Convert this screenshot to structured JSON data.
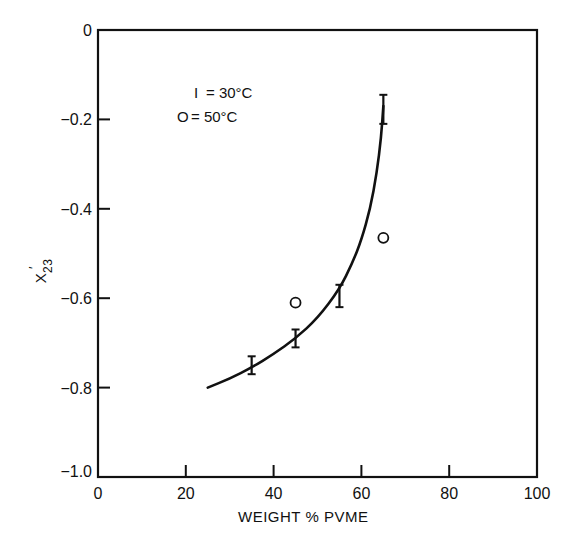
{
  "chart_data": {
    "type": "scatter",
    "title": "",
    "xlabel": "WEIGHT % PVME",
    "ylabel": "X'23",
    "ylabel_main": "X",
    "ylabel_prime": "′",
    "ylabel_sub": "23",
    "xlim": [
      0,
      100
    ],
    "ylim": [
      -1.0,
      0
    ],
    "grid": false,
    "legend_position": "upper-left inside",
    "x_ticks": [
      0,
      20,
      40,
      60,
      80,
      100
    ],
    "x_tick_labels": [
      "0",
      "20",
      "40",
      "60",
      "80",
      "100"
    ],
    "y_ticks": [
      0,
      -0.2,
      -0.4,
      -0.6,
      -0.8,
      -1.0
    ],
    "y_tick_labels": [
      "0",
      "-0.2",
      "-0.4",
      "-0.6",
      "-0.8",
      "-1.0"
    ],
    "legend": [
      {
        "symbol": "I",
        "label": "= 30°C",
        "marker": "errorbar"
      },
      {
        "symbol": "O",
        "label": "= 50°C",
        "marker": "circle"
      }
    ],
    "series": [
      {
        "name": "30°C",
        "marker": "errorbar",
        "points": [
          {
            "x": 35,
            "y": -0.75,
            "ylo": -0.77,
            "yhi": -0.73
          },
          {
            "x": 45,
            "y": -0.69,
            "ylo": -0.71,
            "yhi": -0.67
          },
          {
            "x": 55,
            "y": -0.59,
            "ylo": -0.62,
            "yhi": -0.57
          },
          {
            "x": 65,
            "y": -0.175,
            "ylo": -0.21,
            "yhi": -0.145
          }
        ]
      },
      {
        "name": "50°C",
        "marker": "circle",
        "points": [
          {
            "x": 45,
            "y": -0.61
          },
          {
            "x": 65,
            "y": -0.465
          }
        ]
      },
      {
        "name": "fit curve (30°C)",
        "marker": "line",
        "points": [
          {
            "x": 25,
            "y": -0.8
          },
          {
            "x": 30,
            "y": -0.78
          },
          {
            "x": 35,
            "y": -0.755
          },
          {
            "x": 40,
            "y": -0.725
          },
          {
            "x": 45,
            "y": -0.69
          },
          {
            "x": 50,
            "y": -0.645
          },
          {
            "x": 55,
            "y": -0.58
          },
          {
            "x": 58,
            "y": -0.52
          },
          {
            "x": 60,
            "y": -0.47
          },
          {
            "x": 62,
            "y": -0.4
          },
          {
            "x": 63.5,
            "y": -0.32
          },
          {
            "x": 64.5,
            "y": -0.24
          },
          {
            "x": 65,
            "y": -0.17
          }
        ]
      }
    ]
  }
}
